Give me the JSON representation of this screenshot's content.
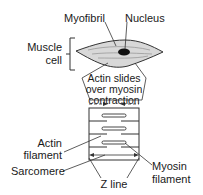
{
  "labels": {
    "myofibril": "Myofibril",
    "nucleus": "Nucleus",
    "muscle_cell_line1": "Muscle",
    "muscle_cell_line2": "cell",
    "callout_line1": "Actin slides",
    "callout_line2": "over myosin",
    "callout_line3": "contraction",
    "actin_line1": "Actin",
    "actin_line2": "filament",
    "sarcomere": "Sarcomere",
    "myosin_line1": "Myosin",
    "myosin_line2": "filament",
    "z_line": "Z line"
  },
  "colors": {
    "stroke": "#333333",
    "cell_fill": "#d8d8d8",
    "nucleus": "#111111",
    "text": "#1a1a1a"
  }
}
